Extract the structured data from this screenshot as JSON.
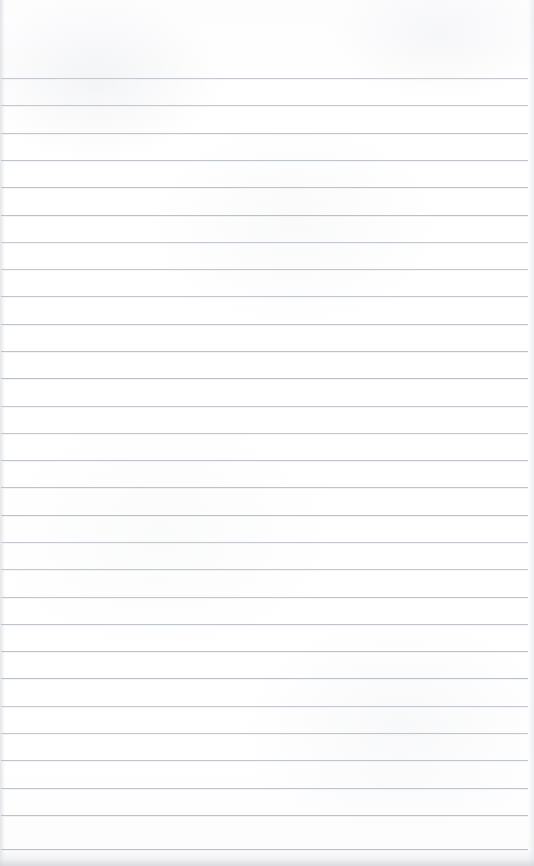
{
  "document": {
    "kind": "lined-paper-scan",
    "title": "Blank ruled notebook page",
    "page_width": 534,
    "page_height": 866,
    "background_color": "#fefeff",
    "has_visible_text": false,
    "body_text": "",
    "header_text": "",
    "footer_text": ""
  },
  "ruling": {
    "line_color": "#b9bec5",
    "line_thickness_px": 1,
    "line_spacing_px": 27.3,
    "first_line_y": 78,
    "line_count": 29,
    "left_inset_px": 1,
    "right_inset_px": 6,
    "top_margin_px": 78,
    "margin_rule_present": false,
    "line_positions": [
      78,
      105,
      133,
      160,
      187,
      215,
      242,
      269,
      296,
      324,
      351,
      378,
      406,
      433,
      460,
      487,
      515,
      542,
      569,
      597,
      624,
      651,
      678,
      706,
      733,
      760,
      788,
      815,
      849
    ]
  },
  "edges": {
    "left_shade_color": "#cdd0d6",
    "right_shade_color": "#d4d7dc",
    "bottom_shadow_color": "#ced0d4"
  }
}
